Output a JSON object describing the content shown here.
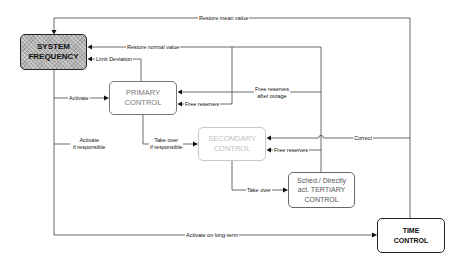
{
  "nodes": {
    "system_frequency": {
      "label": "SYSTEM\nFREQUENCY"
    },
    "primary_control": {
      "label": "PRIMARY\nCONTROL"
    },
    "secondary_control": {
      "label": "SECONDARY\nCONTROL"
    },
    "tertiary_control": {
      "label": "Sched./ Directly\nact. TERTIARY\nCONTROL"
    },
    "time_control": {
      "label": "TIME\nCONTROL"
    }
  },
  "edges": {
    "restore_mean_value": "Restore mean value",
    "restore_normal_value": "Restore normal value",
    "limit_deviation": "Limit Deviation",
    "activate": "Activate",
    "free_reserves_primary": "Free reserves",
    "free_reserves_after_outage": "Free reserves\nafter outage",
    "activate_if_responsible": "Activate\nif responsible",
    "take_over_if_responsible": "Take over\nif responsible",
    "correct": "Correct",
    "free_reserves_secondary": "Free reserves",
    "take_over": "Take over",
    "activate_on_long_term": "Activate on long-term"
  },
  "colors": {
    "system_fill": "#b4b4b4",
    "primary_border": "#777777",
    "secondary_border": "#c8c8c8",
    "line": "#444444"
  }
}
